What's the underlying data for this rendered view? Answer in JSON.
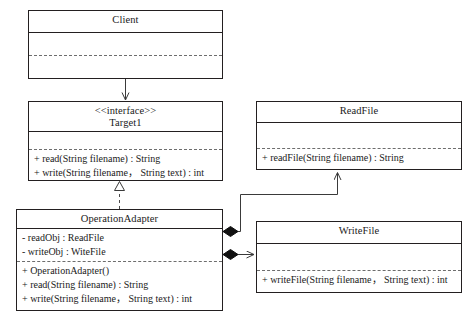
{
  "diagram": {
    "kind": "uml-class-diagram",
    "pattern": "Adapter",
    "line_color": "#3a3a3a",
    "box_border_color": "#231f20",
    "background": "#ffffff"
  },
  "classes": {
    "client": {
      "name": "Client",
      "stereotype": "",
      "attributes": [],
      "operations": []
    },
    "target": {
      "name": "Target1",
      "stereotype": "<<interface>>",
      "attributes": [],
      "operations": [
        "+ read(String filename) : String",
        "+ write(String filename， String text) : int"
      ]
    },
    "operation_adapter": {
      "name": "OperationAdapter",
      "stereotype": "",
      "attributes": [
        "- readObj : ReadFile",
        "- writeObj : WiteFile"
      ],
      "operations": [
        "+ OperationAdapter()",
        "+ read(String filename) : String",
        "+ write(String filename， String text) : int"
      ]
    },
    "read_file": {
      "name": "ReadFile",
      "stereotype": "",
      "attributes": [],
      "operations": [
        "+ readFile(String filename) : String"
      ]
    },
    "write_file": {
      "name": "WriteFile",
      "stereotype": "",
      "attributes": [],
      "operations": [
        "+ writeFile(String filename， String text) : int"
      ]
    }
  },
  "relationships": [
    {
      "id": "client-to-target",
      "type": "association",
      "from": "Client",
      "to": "Target1",
      "arrow": "open-arrow",
      "line": "solid"
    },
    {
      "id": "adapter-realizes-target",
      "type": "realization",
      "from": "OperationAdapter",
      "to": "Target1",
      "arrow": "hollow-triangle",
      "line": "dashed"
    },
    {
      "id": "adapter-composes-readfile",
      "type": "composition",
      "from": "OperationAdapter",
      "to": "ReadFile",
      "arrow": "open-arrow",
      "line": "solid",
      "source_decoration": "filled-diamond"
    },
    {
      "id": "adapter-composes-writefile",
      "type": "composition",
      "from": "OperationAdapter",
      "to": "WriteFile",
      "arrow": "open-arrow",
      "line": "solid",
      "source_decoration": "filled-diamond"
    }
  ]
}
